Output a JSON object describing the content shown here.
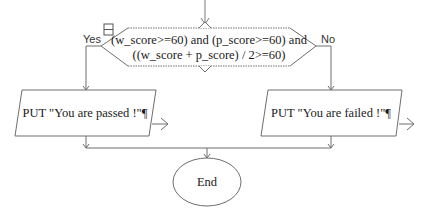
{
  "flowchart": {
    "decision": {
      "line1": "(w_score>=60) and (p_score>=60) and",
      "line2": "((w_score + p_score) / 2>=60)",
      "yes_label": "Yes",
      "no_label": "No"
    },
    "output_yes": {
      "text": "PUT \"You are passed !\"¶"
    },
    "output_no": {
      "text": "PUT \"You are failed !\"¶"
    },
    "terminal_end": {
      "text": "End"
    },
    "colors": {
      "stroke": "#6e6e6e",
      "text": "#1a1a1a",
      "background": "#ffffff"
    }
  }
}
